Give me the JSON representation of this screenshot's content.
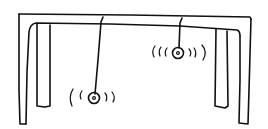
{
  "figure": {
    "ink_color": "#111111",
    "background": "#ffffff",
    "elements": {
      "frame": "table-frame",
      "pendulums": [
        {
          "name": "pendulum-left",
          "length": "long",
          "vibration_marks": "(( ◎ ))"
        },
        {
          "name": "pendulum-right",
          "length": "short",
          "vibration_marks": "((( ◎ ))"
        }
      ]
    }
  }
}
